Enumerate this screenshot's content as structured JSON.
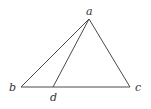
{
  "diagram": {
    "type": "geometry-triangle",
    "points": {
      "a": {
        "label": "a",
        "x": 89,
        "y": 19
      },
      "b": {
        "label": "b",
        "x": 21,
        "y": 87
      },
      "c": {
        "label": "c",
        "x": 130,
        "y": 87
      },
      "d": {
        "label": "d",
        "x": 53,
        "y": 87
      }
    },
    "segments": [
      {
        "from": "a",
        "to": "b"
      },
      {
        "from": "a",
        "to": "c"
      },
      {
        "from": "b",
        "to": "c"
      },
      {
        "from": "a",
        "to": "d"
      }
    ],
    "colors": {
      "line": "#4a4a4a",
      "label": "#333333"
    }
  }
}
